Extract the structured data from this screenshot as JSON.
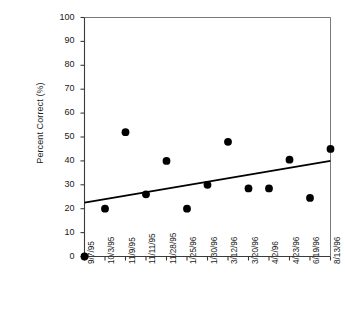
{
  "chart_data": {
    "type": "scatter",
    "title": "",
    "xlabel": "",
    "ylabel": "Percent Correct (%)",
    "ylim": [
      0,
      100
    ],
    "ytick_values": [
      0,
      10,
      20,
      30,
      40,
      50,
      60,
      70,
      80,
      90,
      100
    ],
    "ytick_labels": [
      "0",
      "10",
      "20",
      "30",
      "40",
      "50",
      "60",
      "70",
      "80",
      "90",
      "100"
    ],
    "grid": false,
    "legend": "none",
    "categories": [
      "9/7/95",
      "10/3/95",
      "11/9/95",
      "11/11/95",
      "11/28/95",
      "1/25/96",
      "1/30/96",
      "3/12/96",
      "3/20/96",
      "4/2/96",
      "4/23/96",
      "6/19/96",
      "8/13/96"
    ],
    "values": [
      0,
      20,
      52,
      26,
      40,
      20,
      30,
      48,
      28.5,
      28.5,
      40.5,
      24.5,
      45
    ],
    "marker": {
      "shape": "circle",
      "color": "#000000",
      "size_px": 5.2
    },
    "trendline": {
      "type": "linear-fit",
      "color": "#000000",
      "width_px": 1.8,
      "y_start": 22.5,
      "y_end": 40.0
    },
    "axes": {
      "frame": "box",
      "frame_color": "#7a7a7a",
      "axis_color": "#3a3a3a",
      "tick_direction": "out",
      "x_tick_count": 13
    }
  }
}
